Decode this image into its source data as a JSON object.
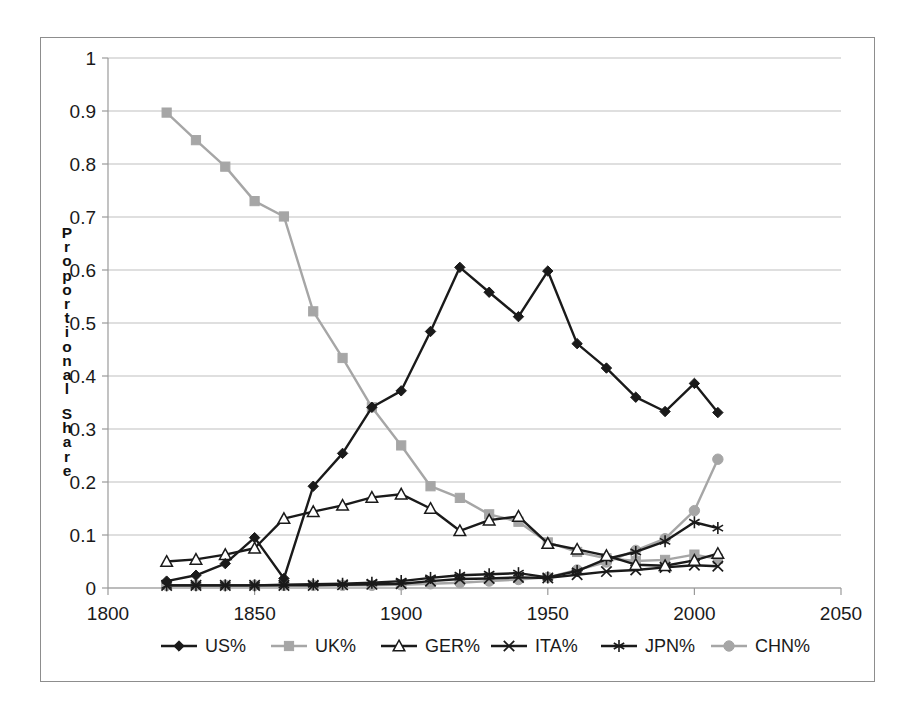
{
  "chart_data": {
    "type": "line",
    "title": "",
    "subtitle": "",
    "xlabel": "",
    "ylabel": "Proportional Share",
    "xlim": [
      1800,
      2050
    ],
    "ylim": [
      0,
      1
    ],
    "xticks": [
      1800,
      1850,
      1900,
      1950,
      2000,
      2050
    ],
    "xtick_labels": [
      "1800",
      "1850",
      "1900",
      "1950",
      "2000",
      "2050"
    ],
    "yticks": [
      0,
      0.1,
      0.2,
      0.3,
      0.4,
      0.5,
      0.6,
      0.7,
      0.8,
      0.9,
      1
    ],
    "ytick_labels": [
      "0",
      "0.1",
      "0.2",
      "0.3",
      "0.4",
      "0.5",
      "0.6",
      "0.7",
      "0.8",
      "0.9",
      "1"
    ],
    "grid": "horizontal",
    "legend_position": "bottom",
    "x": [
      1820,
      1830,
      1840,
      1850,
      1860,
      1870,
      1880,
      1890,
      1900,
      1910,
      1920,
      1930,
      1940,
      1950,
      1960,
      1970,
      1980,
      1990,
      2000,
      2008
    ],
    "series": [
      {
        "name": "US%",
        "marker": "diamond",
        "color": "#1a1a1a",
        "values": [
          0.013,
          0.024,
          0.046,
          0.095,
          0.018,
          0.192,
          0.254,
          0.341,
          0.372,
          0.484,
          0.605,
          0.558,
          0.512,
          0.598,
          0.461,
          0.415,
          0.36,
          0.333,
          0.386,
          0.331
        ]
      },
      {
        "name": "UK%",
        "marker": "square",
        "color": "#a6a6a6",
        "values": [
          0.897,
          0.845,
          0.795,
          0.73,
          0.701,
          0.522,
          0.434,
          0.341,
          0.269,
          0.192,
          0.17,
          0.139,
          0.125,
          0.086,
          0.068,
          0.056,
          0.051,
          0.053,
          0.063,
          0.055
        ]
      },
      {
        "name": "GER%",
        "marker": "triangle",
        "color": "#1a1a1a",
        "values": [
          0.05,
          0.054,
          0.063,
          0.075,
          0.131,
          0.144,
          0.156,
          0.171,
          0.177,
          0.15,
          0.108,
          0.128,
          0.135,
          0.084,
          0.073,
          0.061,
          0.044,
          0.042,
          0.052,
          0.065
        ]
      },
      {
        "name": "ITA%",
        "marker": "x",
        "color": "#1a1a1a",
        "values": [
          0.005,
          0.005,
          0.005,
          0.005,
          0.005,
          0.005,
          0.006,
          0.007,
          0.008,
          0.013,
          0.017,
          0.018,
          0.02,
          0.019,
          0.025,
          0.031,
          0.034,
          0.039,
          0.043,
          0.041
        ]
      },
      {
        "name": "JPN%",
        "marker": "star",
        "color": "#1a1a1a",
        "values": [
          0.005,
          0.005,
          0.005,
          0.005,
          0.006,
          0.007,
          0.008,
          0.01,
          0.013,
          0.019,
          0.024,
          0.026,
          0.028,
          0.02,
          0.032,
          0.055,
          0.068,
          0.088,
          0.124,
          0.113
        ]
      },
      {
        "name": "CHN%",
        "marker": "circle",
        "color": "#a6a6a6",
        "values": [
          0.005,
          0.005,
          0.005,
          0.005,
          0.005,
          0.005,
          0.005,
          0.005,
          0.006,
          0.008,
          0.01,
          0.013,
          0.016,
          0.02,
          0.034,
          0.049,
          0.071,
          0.093,
          0.146,
          0.243
        ]
      }
    ]
  },
  "legend": {
    "entries": [
      {
        "label": "US%"
      },
      {
        "label": "UK%"
      },
      {
        "label": "GER%"
      },
      {
        "label": "ITA%"
      },
      {
        "label": "JPN%"
      },
      {
        "label": "CHN%"
      }
    ]
  },
  "axes": {
    "y_title": "Proportional Share"
  }
}
